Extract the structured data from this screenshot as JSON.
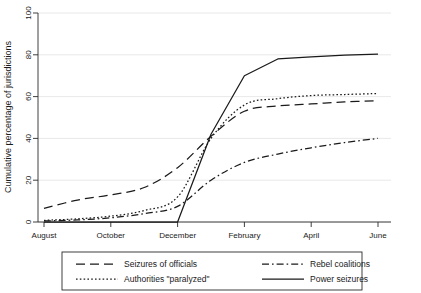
{
  "chart_data": {
    "type": "line",
    "title": "",
    "subtitle": "",
    "xlabel": "",
    "ylabel": "Cumulative percentage of jurisdictions",
    "ylim": [
      0,
      100
    ],
    "yticks": [
      0,
      20,
      40,
      60,
      80,
      100
    ],
    "ytick_labels": [
      "0",
      "20",
      "40",
      "60",
      "80",
      "100"
    ],
    "xticks": [
      "August",
      "October",
      "December",
      "February",
      "April",
      "June"
    ],
    "x": [
      "August",
      "September",
      "October",
      "November",
      "December",
      "January",
      "February",
      "March",
      "April",
      "May",
      "June"
    ],
    "grid": "horizontal",
    "legend_position": "bottom",
    "series": [
      {
        "name": "Seizures of officials",
        "style": "long-dash",
        "values": [
          6.5,
          10.5,
          13.0,
          16.5,
          26.0,
          41.0,
          53.0,
          55.5,
          56.5,
          57.5,
          58.0
        ]
      },
      {
        "name": "Authorities \"paralyzed\"",
        "style": "dotted",
        "values": [
          0.8,
          1.5,
          2.8,
          5.5,
          12.0,
          40.0,
          56.0,
          59.0,
          60.5,
          61.0,
          61.5
        ]
      },
      {
        "name": "Rebel coalitions",
        "style": "dash-dot",
        "values": [
          0.5,
          1.0,
          2.0,
          4.0,
          7.5,
          20.0,
          28.5,
          32.5,
          35.5,
          38.0,
          40.0
        ]
      },
      {
        "name": "Power seizures",
        "style": "solid",
        "values": [
          0.0,
          0.0,
          0.0,
          0.0,
          0.0,
          42.0,
          70.0,
          78.0,
          79.0,
          79.8,
          80.3
        ]
      }
    ]
  },
  "legend": {
    "items": [
      {
        "label": "Seizures of officials",
        "style": "long-dash"
      },
      {
        "label": "Rebel coalitions",
        "style": "dash-dot"
      },
      {
        "label": "Authorities \"paralyzed\"",
        "style": "dotted"
      },
      {
        "label": "Power seizures",
        "style": "solid"
      }
    ]
  }
}
